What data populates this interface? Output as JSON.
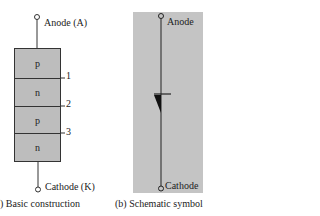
{
  "panel_a": {
    "anode_label": "Anode (A)",
    "cathode_label": "Cathode (K)",
    "layers": [
      "p",
      "n",
      "p",
      "n"
    ],
    "junctions": [
      "1",
      "2",
      "3"
    ],
    "caption": ") Basic construction"
  },
  "panel_b": {
    "anode_label": "Anode",
    "cathode_label": "Cathode",
    "caption": "(b)  Schematic symbol"
  },
  "colors": {
    "layer_fill": "#bdbdbd",
    "symbol_bg": "#c4c4c4",
    "line": "#222222"
  }
}
